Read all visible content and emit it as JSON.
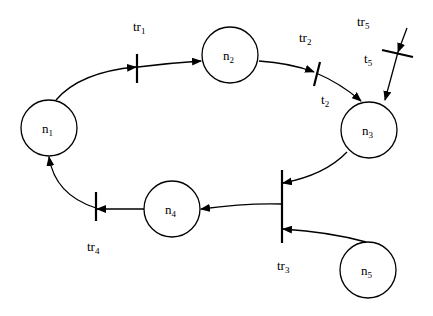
{
  "diagram": {
    "type": "petri-net",
    "colors": {
      "stroke": "#000000",
      "background": "#ffffff"
    },
    "nodes": [
      {
        "id": "n1",
        "base": "n",
        "sub": "1",
        "cx": 49,
        "cy": 128
      },
      {
        "id": "n2",
        "base": "n",
        "sub": "2",
        "cx": 230,
        "cy": 55
      },
      {
        "id": "n3",
        "base": "n",
        "sub": "3",
        "cx": 369,
        "cy": 130
      },
      {
        "id": "n4",
        "base": "n",
        "sub": "4",
        "cx": 172,
        "cy": 209
      },
      {
        "id": "n5",
        "base": "n",
        "sub": "5",
        "cx": 368,
        "cy": 270
      }
    ],
    "transitions": [
      {
        "id": "tr1",
        "base": "tr",
        "sub": "1"
      },
      {
        "id": "tr2",
        "base": "tr",
        "sub": "2"
      },
      {
        "id": "tr3",
        "base": "tr",
        "sub": "3"
      },
      {
        "id": "tr4",
        "base": "tr",
        "sub": "4"
      },
      {
        "id": "tr5",
        "base": "tr",
        "sub": "5"
      }
    ],
    "extra_labels": [
      {
        "id": "t2",
        "base": "t",
        "sub": "2"
      },
      {
        "id": "t5",
        "base": "t",
        "sub": "5"
      }
    ],
    "edges": [
      {
        "from": "n1",
        "to": "tr1"
      },
      {
        "from": "tr1",
        "to": "n2"
      },
      {
        "from": "n2",
        "to": "tr2"
      },
      {
        "from": "tr2",
        "to": "n3"
      },
      {
        "from": "tr5",
        "to": "n3"
      },
      {
        "from": "n3",
        "to": "tr3"
      },
      {
        "from": "n5",
        "to": "tr3"
      },
      {
        "from": "tr3",
        "to": "n4"
      },
      {
        "from": "n4",
        "to": "tr4"
      },
      {
        "from": "tr4",
        "to": "n1"
      }
    ]
  }
}
